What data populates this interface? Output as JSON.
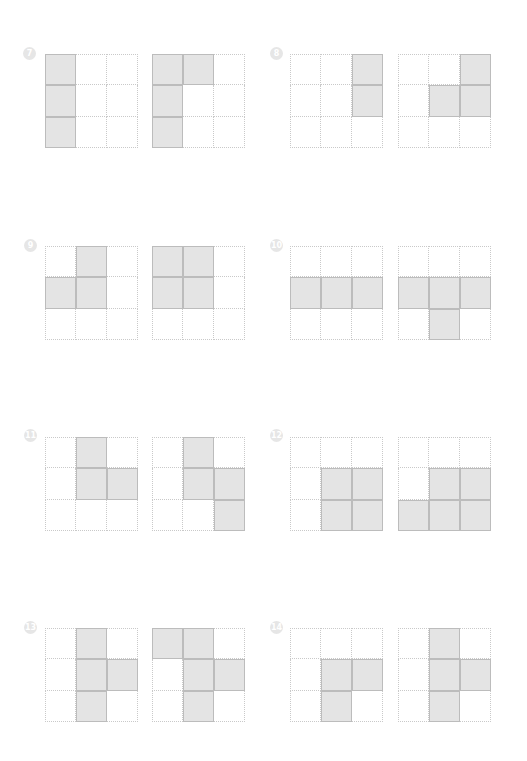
{
  "page": {
    "background": "#ffffff",
    "fill_color": "#e4e4e4",
    "fill_border_color": "#bcbcbc",
    "grid_line_color": "#c9c9c9",
    "badge_color": "#e6e6e6"
  },
  "problems": [
    {
      "number": "7",
      "grids": [
        [
          [
            1,
            0,
            0
          ],
          [
            1,
            0,
            0
          ],
          [
            1,
            0,
            0
          ]
        ],
        [
          [
            1,
            1,
            0
          ],
          [
            1,
            0,
            0
          ],
          [
            1,
            0,
            0
          ]
        ]
      ]
    },
    {
      "number": "8",
      "grids": [
        [
          [
            0,
            0,
            1
          ],
          [
            0,
            0,
            1
          ],
          [
            0,
            0,
            0
          ]
        ],
        [
          [
            0,
            0,
            1
          ],
          [
            0,
            1,
            1
          ],
          [
            0,
            0,
            0
          ]
        ]
      ]
    },
    {
      "number": "9",
      "grids": [
        [
          [
            0,
            1,
            0
          ],
          [
            1,
            1,
            0
          ],
          [
            0,
            0,
            0
          ]
        ],
        [
          [
            1,
            1,
            0
          ],
          [
            1,
            1,
            0
          ],
          [
            0,
            0,
            0
          ]
        ]
      ]
    },
    {
      "number": "10",
      "grids": [
        [
          [
            0,
            0,
            0
          ],
          [
            1,
            1,
            1
          ],
          [
            0,
            0,
            0
          ]
        ],
        [
          [
            0,
            0,
            0
          ],
          [
            1,
            1,
            1
          ],
          [
            0,
            1,
            0
          ]
        ]
      ]
    },
    {
      "number": "11",
      "grids": [
        [
          [
            0,
            1,
            0
          ],
          [
            0,
            1,
            1
          ],
          [
            0,
            0,
            0
          ]
        ],
        [
          [
            0,
            1,
            0
          ],
          [
            0,
            1,
            1
          ],
          [
            0,
            0,
            1
          ]
        ]
      ]
    },
    {
      "number": "12",
      "grids": [
        [
          [
            0,
            0,
            0
          ],
          [
            0,
            1,
            1
          ],
          [
            0,
            1,
            1
          ]
        ],
        [
          [
            0,
            0,
            0
          ],
          [
            0,
            1,
            1
          ],
          [
            1,
            1,
            1
          ]
        ]
      ]
    },
    {
      "number": "13",
      "grids": [
        [
          [
            0,
            1,
            0
          ],
          [
            0,
            1,
            1
          ],
          [
            0,
            1,
            0
          ]
        ],
        [
          [
            1,
            1,
            0
          ],
          [
            0,
            1,
            1
          ],
          [
            0,
            1,
            0
          ]
        ]
      ]
    },
    {
      "number": "14",
      "grids": [
        [
          [
            0,
            0,
            0
          ],
          [
            0,
            1,
            1
          ],
          [
            0,
            1,
            0
          ]
        ],
        [
          [
            0,
            1,
            0
          ],
          [
            0,
            1,
            1
          ],
          [
            0,
            1,
            0
          ]
        ]
      ]
    }
  ]
}
